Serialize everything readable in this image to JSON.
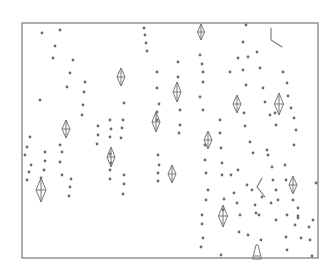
{
  "figure": {
    "width": 333,
    "height": 279,
    "background": "#ffffff",
    "frame": {
      "x": 22,
      "y": 23,
      "w": 296,
      "h": 235,
      "color": "#8a8a8a"
    },
    "dot_color": "#6b6b6b",
    "dot_radius": 1.4,
    "shape_color": "#777777",
    "dots": [
      [
        42,
        33
      ],
      [
        60,
        30
      ],
      [
        55,
        46
      ],
      [
        53,
        58
      ],
      [
        73,
        60
      ],
      [
        70,
        73
      ],
      [
        85,
        82
      ],
      [
        67,
        87
      ],
      [
        84,
        92
      ],
      [
        40,
        100
      ],
      [
        83,
        105
      ],
      [
        82,
        115
      ],
      [
        30,
        137
      ],
      [
        27,
        147
      ],
      [
        25,
        155
      ],
      [
        31,
        165
      ],
      [
        29,
        172
      ],
      [
        27,
        180
      ],
      [
        45,
        152
      ],
      [
        45,
        161
      ],
      [
        44,
        170
      ],
      [
        41,
        178
      ],
      [
        60,
        145
      ],
      [
        62,
        152
      ],
      [
        60,
        162
      ],
      [
        62,
        175
      ],
      [
        71,
        179
      ],
      [
        70,
        187
      ],
      [
        69,
        196
      ],
      [
        98,
        126
      ],
      [
        98,
        135
      ],
      [
        97,
        144
      ],
      [
        110,
        120
      ],
      [
        111,
        129
      ],
      [
        110,
        137
      ],
      [
        110,
        154
      ],
      [
        111,
        163
      ],
      [
        110,
        170
      ],
      [
        110,
        179
      ],
      [
        123,
        120
      ],
      [
        122,
        128
      ],
      [
        121,
        138
      ],
      [
        124,
        175
      ],
      [
        124,
        184
      ],
      [
        123,
        194
      ],
      [
        124,
        103
      ],
      [
        144,
        28
      ],
      [
        145,
        35
      ],
      [
        146,
        43
      ],
      [
        147,
        51
      ],
      [
        157,
        72
      ],
      [
        157,
        88
      ],
      [
        159,
        104
      ],
      [
        157,
        112
      ],
      [
        157,
        120
      ],
      [
        158,
        155
      ],
      [
        159,
        165
      ],
      [
        158,
        173
      ],
      [
        158,
        181
      ],
      [
        178,
        62
      ],
      [
        178,
        77
      ],
      [
        180,
        110
      ],
      [
        180,
        125
      ],
      [
        179,
        133
      ],
      [
        200,
        55
      ],
      [
        202,
        64
      ],
      [
        203,
        72
      ],
      [
        203,
        82
      ],
      [
        200,
        97
      ],
      [
        203,
        110
      ],
      [
        205,
        145
      ],
      [
        205,
        160
      ],
      [
        206,
        173
      ],
      [
        208,
        190
      ],
      [
        206,
        200
      ],
      [
        220,
        120
      ],
      [
        220,
        133
      ],
      [
        221,
        148
      ],
      [
        222,
        163
      ],
      [
        222,
        175
      ],
      [
        202,
        215
      ],
      [
        202,
        224
      ],
      [
        203,
        238
      ],
      [
        201,
        247
      ],
      [
        224,
        199
      ],
      [
        223,
        210
      ],
      [
        221,
        255
      ],
      [
        246,
        25
      ],
      [
        243,
        42
      ],
      [
        238,
        58
      ],
      [
        230,
        72
      ],
      [
        248,
        57
      ],
      [
        243,
        70
      ],
      [
        246,
        85
      ],
      [
        257,
        52
      ],
      [
        260,
        68
      ],
      [
        263,
        88
      ],
      [
        265,
        102
      ],
      [
        270,
        115
      ],
      [
        275,
        113
      ],
      [
        276,
        125
      ],
      [
        267,
        150
      ],
      [
        268,
        155
      ],
      [
        272,
        167
      ],
      [
        273,
        180
      ],
      [
        276,
        190
      ],
      [
        278,
        200
      ],
      [
        244,
        113
      ],
      [
        245,
        126
      ],
      [
        250,
        142
      ],
      [
        253,
        153
      ],
      [
        231,
        175
      ],
      [
        238,
        170
      ],
      [
        234,
        193
      ],
      [
        237,
        203
      ],
      [
        240,
        215
      ],
      [
        239,
        232
      ],
      [
        248,
        235
      ],
      [
        255,
        205
      ],
      [
        256,
        213
      ],
      [
        259,
        215
      ],
      [
        261,
        240
      ],
      [
        283,
        72
      ],
      [
        287,
        83
      ],
      [
        288,
        96
      ],
      [
        291,
        108
      ],
      [
        294,
        118
      ],
      [
        296,
        130
      ],
      [
        294,
        145
      ],
      [
        285,
        165
      ],
      [
        286,
        180
      ],
      [
        293,
        200
      ],
      [
        298,
        208
      ],
      [
        298,
        216
      ],
      [
        295,
        225
      ],
      [
        286,
        237
      ],
      [
        287,
        250
      ],
      [
        247,
        185
      ],
      [
        252,
        190
      ],
      [
        262,
        197
      ],
      [
        271,
        203
      ],
      [
        276,
        220
      ],
      [
        287,
        215
      ],
      [
        298,
        218
      ],
      [
        301,
        238
      ],
      [
        309,
        227
      ],
      [
        310,
        240
      ],
      [
        312,
        256
      ],
      [
        313,
        220
      ],
      [
        316,
        183
      ]
    ],
    "kites": [
      {
        "cx": 41,
        "cy": 190,
        "w": 10,
        "h": 24
      },
      {
        "cx": 66,
        "cy": 129,
        "w": 8,
        "h": 18
      },
      {
        "cx": 111,
        "cy": 157,
        "w": 8,
        "h": 20
      },
      {
        "cx": 121,
        "cy": 77,
        "w": 8,
        "h": 18
      },
      {
        "cx": 156,
        "cy": 122,
        "w": 8,
        "h": 20
      },
      {
        "cx": 172,
        "cy": 174,
        "w": 8,
        "h": 18
      },
      {
        "cx": 177,
        "cy": 92,
        "w": 8,
        "h": 20
      },
      {
        "cx": 201,
        "cy": 32,
        "w": 7,
        "h": 16
      },
      {
        "cx": 208,
        "cy": 140,
        "w": 8,
        "h": 18
      },
      {
        "cx": 223,
        "cy": 216,
        "w": 9,
        "h": 22
      },
      {
        "cx": 237,
        "cy": 104,
        "w": 8,
        "h": 18
      },
      {
        "cx": 279,
        "cy": 104,
        "w": 9,
        "h": 22
      },
      {
        "cx": 293,
        "cy": 185,
        "w": 8,
        "h": 18
      },
      {
        "cx": 257,
        "cy": 252,
        "w": 9,
        "h": 14,
        "open_bottom": true
      }
    ],
    "marks": [
      {
        "points": [
          [
            271,
            28
          ],
          [
            271,
            40
          ],
          [
            282,
            47
          ]
        ],
        "comment": "L-mark top right"
      },
      {
        "points": [
          [
            262,
            178
          ],
          [
            257,
            187
          ],
          [
            265,
            197
          ]
        ],
        "comment": "less-than mark"
      }
    ]
  }
}
